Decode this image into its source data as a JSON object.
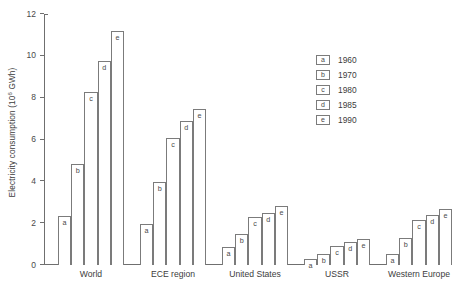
{
  "chart_data": {
    "type": "bar",
    "title": "",
    "xlabel": "",
    "ylabel": "Electricity consumption (10⁶ GWh)",
    "ylabel_base": "Electricity consumption (10",
    "ylabel_exp": "6",
    "ylabel_tail": " GWh)",
    "ylim": [
      0,
      12
    ],
    "yticks": [
      0,
      2,
      4,
      6,
      8,
      10,
      12
    ],
    "ytick_labels": [
      "0",
      "2",
      "4",
      "6",
      "8",
      "10",
      "12"
    ],
    "grid": false,
    "legend_position": "inside-upper-right",
    "series_keys": [
      "a",
      "b",
      "c",
      "d",
      "e"
    ],
    "legend": [
      {
        "key": "a",
        "label": "1960"
      },
      {
        "key": "b",
        "label": "1970"
      },
      {
        "key": "c",
        "label": "1980"
      },
      {
        "key": "d",
        "label": "1985"
      },
      {
        "key": "e",
        "label": "1990"
      }
    ],
    "categories": [
      "World",
      "ECE region",
      "United States",
      "USSR",
      "Western Europe"
    ],
    "series": [
      {
        "name": "1960",
        "key": "a",
        "values": [
          2.35,
          1.95,
          0.85,
          0.3,
          0.55
        ]
      },
      {
        "name": "1970",
        "key": "b",
        "values": [
          4.85,
          3.95,
          1.5,
          0.55,
          1.3
        ]
      },
      {
        "name": "1980",
        "key": "c",
        "values": [
          8.25,
          6.05,
          2.3,
          0.9,
          2.15
        ]
      },
      {
        "name": "1985",
        "key": "d",
        "values": [
          9.75,
          6.9,
          2.5,
          1.1,
          2.4
        ]
      },
      {
        "name": "1990",
        "key": "e",
        "values": [
          11.2,
          7.45,
          2.8,
          1.25,
          2.7
        ]
      }
    ],
    "groups": [
      {
        "category": "World",
        "bars": [
          {
            "key": "a",
            "year": "1960",
            "value": 2.35
          },
          {
            "key": "b",
            "year": "1970",
            "value": 4.85
          },
          {
            "key": "c",
            "year": "1980",
            "value": 8.25
          },
          {
            "key": "d",
            "year": "1985",
            "value": 9.75
          },
          {
            "key": "e",
            "year": "1990",
            "value": 11.2
          }
        ]
      },
      {
        "category": "ECE region",
        "bars": [
          {
            "key": "a",
            "year": "1960",
            "value": 1.95
          },
          {
            "key": "b",
            "year": "1970",
            "value": 3.95
          },
          {
            "key": "c",
            "year": "1980",
            "value": 6.05
          },
          {
            "key": "d",
            "year": "1985",
            "value": 6.9
          },
          {
            "key": "e",
            "year": "1990",
            "value": 7.45
          }
        ]
      },
      {
        "category": "United States",
        "bars": [
          {
            "key": "a",
            "year": "1960",
            "value": 0.85
          },
          {
            "key": "b",
            "year": "1970",
            "value": 1.5
          },
          {
            "key": "c",
            "year": "1980",
            "value": 2.3
          },
          {
            "key": "d",
            "year": "1985",
            "value": 2.5
          },
          {
            "key": "e",
            "year": "1990",
            "value": 2.8
          }
        ]
      },
      {
        "category": "USSR",
        "bars": [
          {
            "key": "a",
            "year": "1960",
            "value": 0.3
          },
          {
            "key": "b",
            "year": "1970",
            "value": 0.55
          },
          {
            "key": "c",
            "year": "1980",
            "value": 0.9
          },
          {
            "key": "d",
            "year": "1985",
            "value": 1.1
          },
          {
            "key": "e",
            "year": "1990",
            "value": 1.25
          }
        ]
      },
      {
        "category": "Western Europe",
        "bars": [
          {
            "key": "a",
            "year": "1960",
            "value": 0.55
          },
          {
            "key": "b",
            "year": "1970",
            "value": 1.3
          },
          {
            "key": "c",
            "year": "1980",
            "value": 2.15
          },
          {
            "key": "d",
            "year": "1985",
            "value": 2.4
          },
          {
            "key": "e",
            "year": "1990",
            "value": 2.7
          }
        ]
      }
    ],
    "colors": {
      "bar_fill": "#ffffff",
      "bar_stroke": "#7b7b7b",
      "axis": "#6f6f6f",
      "text": "#3c3c3c",
      "background": "#ffffff"
    }
  }
}
